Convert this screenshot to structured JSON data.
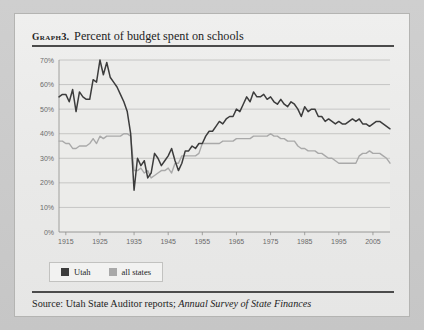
{
  "figure": {
    "label": "Graph",
    "number": "3.",
    "title": "Percent of budget spent on schools"
  },
  "source": {
    "prefix": "Source: Utah State Auditor reports;",
    "italic_title": "Annual Survey of State Finances"
  },
  "legend": {
    "position": "below-plot",
    "items": [
      {
        "label": "Utah",
        "color": "#3c3c3c"
      },
      {
        "label": "all states",
        "color": "#a9a9a9"
      }
    ]
  },
  "colors": {
    "utah": "#3c3c3c",
    "all_states": "#a9a9a9",
    "gridline": "#bdbdbb",
    "axis": "#8e8e8c",
    "tick_label": "#6a6a6a",
    "rule": "#4b4b4b",
    "card_bg": "#ececeb",
    "page_bg": "#c9c9c9"
  },
  "chart_data": {
    "type": "line",
    "title": "Percent of budget spent on schools",
    "xlabel": "",
    "ylabel": "",
    "xlim": [
      1913,
      2010
    ],
    "ylim": [
      0,
      70
    ],
    "grid": true,
    "legend_position": "bottom-left",
    "y_ticks": [
      0,
      10,
      20,
      30,
      40,
      50,
      60,
      70
    ],
    "y_tick_labels": [
      "0%",
      "10%",
      "20%",
      "30%",
      "40%",
      "50%",
      "60%",
      "70%"
    ],
    "x_ticks": [
      1915,
      1925,
      1935,
      1945,
      1955,
      1965,
      1975,
      1985,
      1995,
      2005
    ],
    "x_tick_labels": [
      "1915",
      "1925",
      "1935",
      "1945",
      "1955",
      "1965",
      "1975",
      "1985",
      "1995",
      "2005"
    ],
    "series": [
      {
        "name": "Utah",
        "color": "#3c3c3c",
        "x": [
          1913,
          1914,
          1915,
          1916,
          1917,
          1918,
          1919,
          1920,
          1921,
          1922,
          1923,
          1924,
          1925,
          1926,
          1927,
          1928,
          1929,
          1930,
          1931,
          1932,
          1933,
          1934,
          1935,
          1936,
          1937,
          1938,
          1939,
          1940,
          1941,
          1942,
          1943,
          1944,
          1945,
          1946,
          1947,
          1948,
          1949,
          1950,
          1951,
          1952,
          1953,
          1954,
          1955,
          1956,
          1957,
          1958,
          1959,
          1960,
          1961,
          1962,
          1963,
          1964,
          1965,
          1966,
          1967,
          1968,
          1969,
          1970,
          1971,
          1972,
          1973,
          1974,
          1975,
          1976,
          1977,
          1978,
          1979,
          1980,
          1981,
          1982,
          1983,
          1984,
          1985,
          1986,
          1987,
          1988,
          1989,
          1990,
          1991,
          1992,
          1993,
          1994,
          1995,
          1996,
          1997,
          1998,
          1999,
          2000,
          2001,
          2002,
          2003,
          2004,
          2005,
          2006,
          2007,
          2008,
          2009,
          2010
        ],
        "y": [
          55,
          56,
          56,
          53,
          58,
          49,
          57,
          55,
          54,
          54,
          62,
          61,
          70,
          64,
          69,
          63,
          61,
          59,
          56,
          53,
          49,
          40,
          17,
          30,
          27,
          29,
          22,
          24,
          32,
          30,
          27,
          29,
          31,
          34,
          29,
          25,
          28,
          33,
          33,
          35,
          34,
          36,
          36,
          39,
          41,
          41,
          43,
          45,
          44,
          46,
          47,
          47,
          50,
          49,
          52,
          55,
          53,
          57,
          55,
          55,
          56,
          54,
          55,
          53,
          52,
          54,
          52,
          51,
          53,
          52,
          50,
          47,
          51,
          49,
          50,
          50,
          47,
          47,
          45,
          46,
          45,
          44,
          45,
          44,
          44,
          45,
          46,
          45,
          46,
          44,
          44,
          43,
          44,
          45,
          45,
          44,
          43,
          42
        ]
      },
      {
        "name": "all states",
        "color": "#a9a9a9",
        "x": [
          1913,
          1914,
          1915,
          1916,
          1917,
          1918,
          1919,
          1920,
          1921,
          1922,
          1923,
          1924,
          1925,
          1926,
          1927,
          1928,
          1929,
          1930,
          1931,
          1932,
          1933,
          1934,
          1935,
          1936,
          1937,
          1938,
          1939,
          1940,
          1941,
          1942,
          1943,
          1944,
          1945,
          1946,
          1947,
          1948,
          1949,
          1950,
          1951,
          1952,
          1953,
          1954,
          1955,
          1956,
          1957,
          1958,
          1959,
          1960,
          1961,
          1962,
          1963,
          1964,
          1965,
          1966,
          1967,
          1968,
          1969,
          1970,
          1971,
          1972,
          1973,
          1974,
          1975,
          1976,
          1977,
          1978,
          1979,
          1980,
          1981,
          1982,
          1983,
          1984,
          1985,
          1986,
          1987,
          1988,
          1989,
          1990,
          1991,
          1992,
          1993,
          1994,
          1995,
          1996,
          1997,
          1998,
          1999,
          2000,
          2001,
          2002,
          2003,
          2004,
          2005,
          2006,
          2007,
          2008,
          2009,
          2010
        ],
        "y": [
          37,
          37,
          36,
          36,
          34,
          34,
          35,
          35,
          35,
          36,
          38,
          36,
          39,
          38,
          39,
          39,
          39,
          39,
          39,
          40,
          40,
          39,
          25,
          25,
          26,
          24,
          25,
          22,
          23,
          24,
          25,
          25,
          26,
          24,
          28,
          28,
          31,
          31,
          31,
          31,
          31,
          32,
          36,
          36,
          36,
          36,
          36,
          36,
          37,
          37,
          37,
          37,
          38,
          38,
          38,
          38,
          38,
          39,
          39,
          39,
          39,
          39,
          40,
          39,
          39,
          38,
          38,
          37,
          37,
          37,
          35,
          34,
          34,
          33,
          33,
          33,
          32,
          32,
          31,
          30,
          30,
          29,
          28,
          28,
          28,
          28,
          28,
          28,
          31,
          32,
          32,
          33,
          32,
          32,
          32,
          31,
          30,
          28
        ]
      }
    ]
  }
}
